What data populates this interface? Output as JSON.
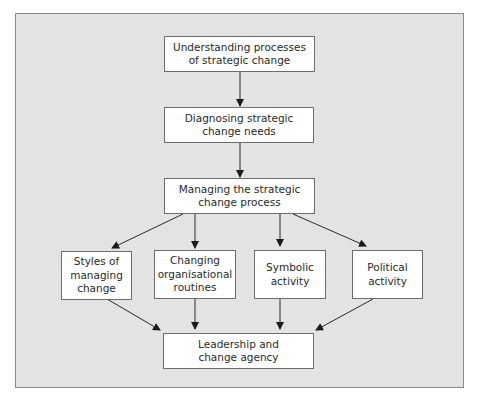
{
  "diagram": {
    "type": "flowchart",
    "nodes": {
      "understanding": "Understanding processes\nof strategic change",
      "diagnosing": "Diagnosing strategic\nchange needs",
      "managing": "Managing the strategic\nchange process",
      "styles": "Styles of\nmanaging\nchange",
      "routines": "Changing\norganisational\nroutines",
      "symbolic": "Symbolic\nactivity",
      "political": "Political\nactivity",
      "leadership": "Leadership and\nchange agency"
    },
    "edges": [
      [
        "understanding",
        "diagnosing"
      ],
      [
        "diagnosing",
        "managing"
      ],
      [
        "managing",
        "styles"
      ],
      [
        "managing",
        "routines"
      ],
      [
        "managing",
        "symbolic"
      ],
      [
        "managing",
        "political"
      ],
      [
        "styles",
        "leadership"
      ],
      [
        "routines",
        "leadership"
      ],
      [
        "symbolic",
        "leadership"
      ],
      [
        "political",
        "leadership"
      ]
    ]
  }
}
